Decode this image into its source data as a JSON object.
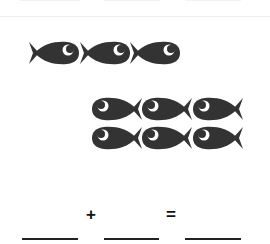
{
  "worksheet": {
    "fish_color": "#333333",
    "group_left": {
      "rows": 1,
      "count": 3
    },
    "group_right": {
      "rows": 2,
      "per_row": 3,
      "count": 6
    },
    "equation": {
      "plus": "+",
      "equals": "=",
      "blanks": [
        "",
        "",
        ""
      ]
    }
  }
}
